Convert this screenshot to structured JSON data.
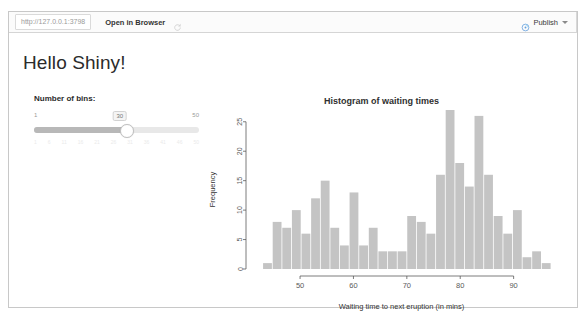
{
  "window": {
    "toolbar": {
      "url_value": "http://127.0.0.1:3798",
      "open_in_browser_label": "Open in Browser",
      "refresh_icon": "refresh-icon",
      "publish_label": "Publish",
      "publish_icon": "publish-icon",
      "caret_icon": "chevron-down-icon"
    }
  },
  "app": {
    "title": "Hello Shiny!",
    "sidebar": {
      "slider": {
        "label": "Number of bins:",
        "min_label": "1",
        "max_label": "50",
        "value_label": "30",
        "value": 30,
        "min": 1,
        "max": 50,
        "tick_labels": [
          "1",
          "6",
          "11",
          "16",
          "21",
          "26",
          "31",
          "36",
          "41",
          "46",
          "50"
        ]
      }
    }
  },
  "chart_data": {
    "type": "bar",
    "title": "Histogram of waiting times",
    "xlabel": "Waiting time to next eruption (in mins)",
    "ylabel": "Frequency",
    "xlim": [
      41,
      97
    ],
    "ylim": [
      0,
      27
    ],
    "xticks": [
      50,
      60,
      70,
      80,
      90
    ],
    "yticks": [
      0,
      5,
      10,
      15,
      20,
      25
    ],
    "grid": false,
    "legend": "none",
    "bin_width": 1.8,
    "bin_starts": [
      43.0,
      44.8,
      46.6,
      48.4,
      50.2,
      52.0,
      53.8,
      55.6,
      57.4,
      59.2,
      61.0,
      62.8,
      64.6,
      66.4,
      68.2,
      70.0,
      71.8,
      73.6,
      75.4,
      77.2,
      79.0,
      80.8,
      82.6,
      84.4,
      86.2,
      88.0,
      89.8,
      91.6,
      93.4,
      95.2
    ],
    "categories": [
      "43.0",
      "44.8",
      "46.6",
      "48.4",
      "50.2",
      "52.0",
      "53.8",
      "55.6",
      "57.4",
      "59.2",
      "61.0",
      "62.8",
      "64.6",
      "66.4",
      "68.2",
      "70.0",
      "71.8",
      "73.6",
      "75.4",
      "77.2",
      "79.0",
      "80.8",
      "82.6",
      "84.4",
      "86.2",
      "88.0",
      "89.8",
      "91.6",
      "93.4",
      "95.2"
    ],
    "values": [
      1,
      8,
      7,
      10,
      6,
      12,
      15,
      7,
      4,
      13,
      4,
      7,
      3,
      3,
      3,
      9,
      8,
      6,
      16,
      27,
      18,
      14,
      26,
      16,
      9,
      6,
      10,
      2,
      3,
      1
    ],
    "bar_color": "#c4c4c4",
    "axis_color": "#5a5a5a"
  }
}
